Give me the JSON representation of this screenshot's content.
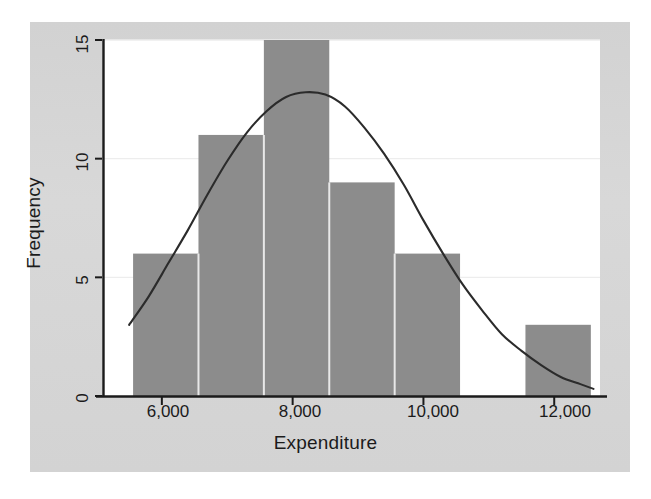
{
  "chart_data": {
    "type": "bar",
    "title": "",
    "subtitle": "",
    "xlabel": "Expenditure",
    "ylabel": "Frequency",
    "xlim": [
      5100,
      12700
    ],
    "ylim": [
      0,
      15
    ],
    "xticks": [
      "6,000",
      "8,000",
      "10,000",
      "12,000"
    ],
    "xtick_values": [
      6000,
      8000,
      10000,
      12000
    ],
    "yticks": [
      "0",
      "5",
      "10",
      "15"
    ],
    "ytick_values": [
      0,
      5,
      10,
      15
    ],
    "grid": true,
    "legend": "none",
    "bin_width": 1000,
    "bins": [
      {
        "label": "5,560-6,560",
        "start": 5560,
        "end": 6560,
        "value": 6
      },
      {
        "label": "6,560-7,560",
        "start": 6560,
        "end": 7560,
        "value": 11
      },
      {
        "label": "7,560-8,560",
        "start": 7560,
        "end": 8560,
        "value": 15
      },
      {
        "label": "8,560-9,560",
        "start": 8560,
        "end": 9560,
        "value": 9
      },
      {
        "label": "9,560-10,560",
        "start": 9560,
        "end": 10560,
        "value": 6
      },
      {
        "label": "10,560-11,560",
        "start": 10560,
        "end": 11560,
        "value": 0
      },
      {
        "label": "11,560-12,560",
        "start": 11560,
        "end": 12560,
        "value": 3
      }
    ],
    "categories": [
      "5,560-6,560",
      "6,560-7,560",
      "7,560-8,560",
      "8,560-9,560",
      "9,560-10,560",
      "10,560-11,560",
      "11,560-12,560"
    ],
    "values": [
      6,
      11,
      15,
      9,
      6,
      0,
      3
    ],
    "overlay": {
      "name": "normal-curve",
      "type": "line",
      "mean": 8400,
      "std": 1550,
      "peak_value": 12.8,
      "points": [
        {
          "x": 5500,
          "y": 3.0
        },
        {
          "x": 5800,
          "y": 4.2
        },
        {
          "x": 6100,
          "y": 5.6
        },
        {
          "x": 6400,
          "y": 7.0
        },
        {
          "x": 6700,
          "y": 8.5
        },
        {
          "x": 7000,
          "y": 9.9
        },
        {
          "x": 7300,
          "y": 11.1
        },
        {
          "x": 7600,
          "y": 12.0
        },
        {
          "x": 7900,
          "y": 12.6
        },
        {
          "x": 8200,
          "y": 12.8
        },
        {
          "x": 8500,
          "y": 12.7
        },
        {
          "x": 8800,
          "y": 12.2
        },
        {
          "x": 9100,
          "y": 11.3
        },
        {
          "x": 9400,
          "y": 10.2
        },
        {
          "x": 9700,
          "y": 8.9
        },
        {
          "x": 10000,
          "y": 7.4
        },
        {
          "x": 10300,
          "y": 6.0
        },
        {
          "x": 10600,
          "y": 4.7
        },
        {
          "x": 10900,
          "y": 3.6
        },
        {
          "x": 11200,
          "y": 2.6
        },
        {
          "x": 11500,
          "y": 1.9
        },
        {
          "x": 11800,
          "y": 1.3
        },
        {
          "x": 12100,
          "y": 0.8
        },
        {
          "x": 12400,
          "y": 0.5
        },
        {
          "x": 12600,
          "y": 0.3
        }
      ]
    }
  },
  "colors": {
    "bar_fill": "#8c8c8c",
    "bar_separator": "#e8e8e8",
    "curve": "#2b2b2b",
    "axis": "#1b1b1b",
    "grid": "#ededed",
    "plot_background": "#ffffff",
    "panel_background": "#d5d5d5",
    "text": "#1b1b1b"
  }
}
